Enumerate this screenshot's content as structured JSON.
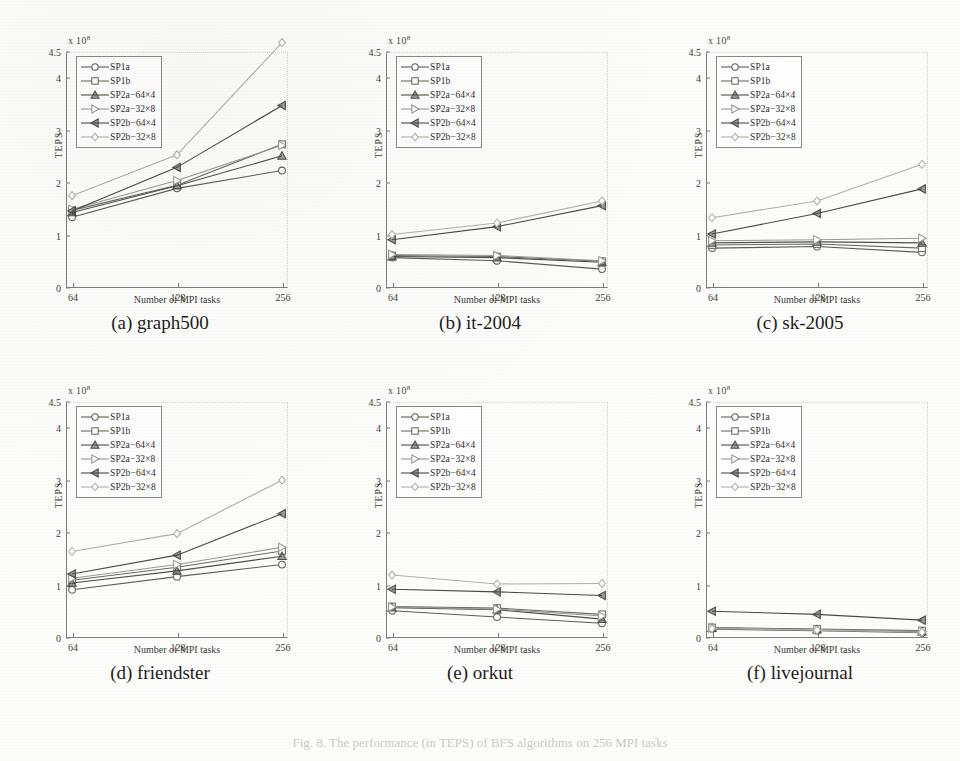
{
  "figure": {
    "caption": "Fig. 8. The performance (in TEPS) of BFS algorithms on 256 MPI tasks",
    "background": "#fdfdfb",
    "ink": "#3b3b37"
  },
  "series_defs": [
    {
      "key": "SP1a",
      "label": "SP1a",
      "marker": "circle",
      "color": "#5d5d58"
    },
    {
      "key": "SP1b",
      "label": "SP1b",
      "marker": "square",
      "color": "#6a6a64"
    },
    {
      "key": "SP2a-64x4",
      "label": "SP2a−64×4",
      "marker": "triangle-up",
      "color": "#4f4f4a"
    },
    {
      "key": "SP2a-32x8",
      "label": "SP2a−32×8",
      "marker": "triangle-right",
      "color": "#9a9a94"
    },
    {
      "key": "SP2b-64x4",
      "label": "SP2b−64×4",
      "marker": "triangle-left",
      "color": "#4a4a45"
    },
    {
      "key": "SP2b-32x8",
      "label": "SP2b−32×8",
      "marker": "diamond",
      "color": "#b0b0a9"
    }
  ],
  "chart_data": [
    {
      "id": "a",
      "type": "line",
      "panel_label": "(a) graph500",
      "title": "graph500",
      "xlabel": "Number of MPI tasks",
      "ylabel": "TEPS",
      "exponent_label": "x 10",
      "exponent_power": "8",
      "categories": [
        "64",
        "128",
        "256"
      ],
      "x": [
        64,
        128,
        256
      ],
      "xlim": [
        64,
        256
      ],
      "ylim": [
        0,
        4.5
      ],
      "yticks": [
        0,
        1,
        2,
        3,
        4,
        4.5
      ],
      "ytick_labels": [
        "0",
        "1",
        "2",
        "3",
        "4",
        "4.5"
      ],
      "grid": false,
      "legend_position": "upper-left",
      "series": [
        {
          "name": "SP1a",
          "values": [
            1.35,
            1.9,
            2.24
          ]
        },
        {
          "name": "SP1b",
          "values": [
            1.48,
            1.96,
            2.74
          ]
        },
        {
          "name": "SP2a-64x4",
          "values": [
            1.44,
            1.95,
            2.52
          ]
        },
        {
          "name": "SP2a-32x8",
          "values": [
            1.5,
            2.05,
            2.72
          ]
        },
        {
          "name": "SP2b-64x4",
          "values": [
            1.47,
            2.3,
            3.48
          ]
        },
        {
          "name": "SP2b-32x8",
          "values": [
            1.76,
            2.54,
            4.68
          ]
        }
      ]
    },
    {
      "id": "b",
      "type": "line",
      "panel_label": "(b) it-2004",
      "title": "it-2004",
      "xlabel": "Number of MPI tasks",
      "ylabel": "TEPS",
      "exponent_label": "x 10",
      "exponent_power": "8",
      "categories": [
        "64",
        "128",
        "256"
      ],
      "x": [
        64,
        128,
        256
      ],
      "xlim": [
        64,
        256
      ],
      "ylim": [
        0,
        4.5
      ],
      "yticks": [
        0,
        1,
        2,
        3,
        4,
        4.5
      ],
      "ytick_labels": [
        "0",
        "1",
        "2",
        "3",
        "4",
        "4.5"
      ],
      "grid": false,
      "legend_position": "upper-left",
      "series": [
        {
          "name": "SP1a",
          "values": [
            0.58,
            0.52,
            0.36
          ]
        },
        {
          "name": "SP1b",
          "values": [
            0.62,
            0.6,
            0.51
          ]
        },
        {
          "name": "SP2a-64x4",
          "values": [
            0.6,
            0.58,
            0.49
          ]
        },
        {
          "name": "SP2a-32x8",
          "values": [
            0.64,
            0.62,
            0.52
          ]
        },
        {
          "name": "SP2b-64x4",
          "values": [
            0.92,
            1.17,
            1.57
          ]
        },
        {
          "name": "SP2b-32x8",
          "values": [
            1.02,
            1.24,
            1.66
          ]
        }
      ]
    },
    {
      "id": "c",
      "type": "line",
      "panel_label": "(c) sk-2005",
      "title": "sk-2005",
      "xlabel": "Number of MPI tasks",
      "ylabel": "TEPS",
      "exponent_label": "x 10",
      "exponent_power": "8",
      "categories": [
        "64",
        "128",
        "256"
      ],
      "x": [
        64,
        128,
        256
      ],
      "xlim": [
        64,
        256
      ],
      "ylim": [
        0,
        4.5
      ],
      "yticks": [
        0,
        1,
        2,
        3,
        4,
        4.5
      ],
      "ytick_labels": [
        "0",
        "1",
        "2",
        "3",
        "4",
        "4.5"
      ],
      "grid": false,
      "legend_position": "upper-left",
      "series": [
        {
          "name": "SP1a",
          "values": [
            0.76,
            0.79,
            0.68
          ]
        },
        {
          "name": "SP1b",
          "values": [
            0.82,
            0.84,
            0.76
          ]
        },
        {
          "name": "SP2a-64x4",
          "values": [
            0.86,
            0.88,
            0.86
          ]
        },
        {
          "name": "SP2a-32x8",
          "values": [
            0.9,
            0.92,
            0.95
          ]
        },
        {
          "name": "SP2b-64x4",
          "values": [
            1.03,
            1.42,
            1.89
          ]
        },
        {
          "name": "SP2b-32x8",
          "values": [
            1.34,
            1.66,
            2.36
          ]
        }
      ]
    },
    {
      "id": "d",
      "type": "line",
      "panel_label": "(d) friendster",
      "title": "friendster",
      "xlabel": "Number of MPI tasks",
      "ylabel": "TEPS",
      "exponent_label": "x 10",
      "exponent_power": "8",
      "categories": [
        "64",
        "128",
        "256"
      ],
      "x": [
        64,
        128,
        256
      ],
      "xlim": [
        64,
        256
      ],
      "ylim": [
        0,
        4.5
      ],
      "yticks": [
        0,
        1,
        2,
        3,
        4,
        4.5
      ],
      "ytick_labels": [
        "0",
        "1",
        "2",
        "3",
        "4",
        "4.5"
      ],
      "grid": false,
      "legend_position": "upper-left",
      "series": [
        {
          "name": "SP1a",
          "values": [
            0.92,
            1.17,
            1.4
          ]
        },
        {
          "name": "SP1b",
          "values": [
            1.1,
            1.35,
            1.66
          ]
        },
        {
          "name": "SP2a-64x4",
          "values": [
            1.05,
            1.28,
            1.56
          ]
        },
        {
          "name": "SP2a-32x8",
          "values": [
            1.14,
            1.4,
            1.73
          ]
        },
        {
          "name": "SP2b-64x4",
          "values": [
            1.22,
            1.58,
            2.37
          ]
        },
        {
          "name": "SP2b-32x8",
          "values": [
            1.65,
            1.99,
            3.01
          ]
        }
      ]
    },
    {
      "id": "e",
      "type": "line",
      "panel_label": "(e) orkut",
      "title": "orkut",
      "xlabel": "Number of MPI tasks",
      "ylabel": "TEPS",
      "exponent_label": "x 10",
      "exponent_power": "8",
      "categories": [
        "64",
        "128",
        "256"
      ],
      "x": [
        64,
        128,
        256
      ],
      "xlim": [
        64,
        256
      ],
      "ylim": [
        0,
        4.5
      ],
      "yticks": [
        0,
        1,
        2,
        3,
        4,
        4.5
      ],
      "ytick_labels": [
        "0",
        "1",
        "2",
        "3",
        "4",
        "4.5"
      ],
      "grid": false,
      "legend_position": "upper-left",
      "series": [
        {
          "name": "SP1a",
          "values": [
            0.52,
            0.4,
            0.28
          ]
        },
        {
          "name": "SP1b",
          "values": [
            0.6,
            0.57,
            0.45
          ]
        },
        {
          "name": "SP2a-64x4",
          "values": [
            0.58,
            0.54,
            0.36
          ]
        },
        {
          "name": "SP2a-32x8",
          "values": [
            0.59,
            0.55,
            0.42
          ]
        },
        {
          "name": "SP2b-64x4",
          "values": [
            0.93,
            0.88,
            0.81
          ]
        },
        {
          "name": "SP2b-32x8",
          "values": [
            1.2,
            1.03,
            1.04
          ]
        }
      ]
    },
    {
      "id": "f",
      "type": "line",
      "panel_label": "(f) livejournal",
      "title": "livejournal",
      "xlabel": "Number of MPI tasks",
      "ylabel": "TEPS",
      "exponent_label": "x 10",
      "exponent_power": "8",
      "categories": [
        "64",
        "128",
        "256"
      ],
      "x": [
        64,
        128,
        256
      ],
      "xlim": [
        64,
        256
      ],
      "ylim": [
        0,
        4.5
      ],
      "yticks": [
        0,
        1,
        2,
        3,
        4,
        4.5
      ],
      "ytick_labels": [
        "0",
        "1",
        "2",
        "3",
        "4",
        "4.5"
      ],
      "grid": false,
      "legend_position": "upper-left",
      "series": [
        {
          "name": "SP1a",
          "values": [
            0.17,
            0.14,
            0.1
          ]
        },
        {
          "name": "SP1b",
          "values": [
            0.2,
            0.17,
            0.14
          ]
        },
        {
          "name": "SP2a-64x4",
          "values": [
            0.19,
            0.16,
            0.12
          ]
        },
        {
          "name": "SP2a-32x8",
          "values": [
            0.19,
            0.16,
            0.13
          ]
        },
        {
          "name": "SP2b-64x4",
          "values": [
            0.51,
            0.45,
            0.34
          ]
        },
        {
          "name": "SP2b-32x8",
          "values": [
            0.18,
            0.15,
            0.11
          ]
        }
      ]
    }
  ]
}
